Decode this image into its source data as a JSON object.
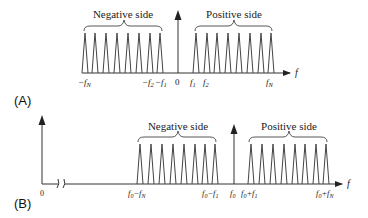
{
  "panels": {
    "a": {
      "label": "(A)",
      "negative_side_label": "Negative side",
      "positive_side_label": "Positive side",
      "axis_label": "f",
      "origin_label": "0",
      "tick_labels": {
        "neg_n": "−f",
        "neg_n_sub": "N",
        "neg_2": "−f",
        "neg_2_sub": "2",
        "neg_1": "−f",
        "neg_1_sub": "1",
        "pos_1": "f",
        "pos_1_sub": "1",
        "pos_2": "f",
        "pos_2_sub": "2",
        "pos_n": "f",
        "pos_n_sub": "N"
      },
      "peak_count_per_side": 8
    },
    "b": {
      "label": "(B)",
      "negative_side_label": "Negative side",
      "positive_side_label": "Positive side",
      "axis_label": "f",
      "origin_label": "0",
      "tick_labels": {
        "f0_minus_fn": "f",
        "f0_minus_fn_mid": "0",
        "f0_minus_fn_op": "−f",
        "f0_minus_fn_sub": "N",
        "f0_minus_f1": "f",
        "f0_minus_f1_mid": "0",
        "f0_minus_f1_op": "−f",
        "f0_minus_f1_sub": "1",
        "f0": "f",
        "f0_sub": "0",
        "f0_plus_f1": "f",
        "f0_plus_f1_mid": "0",
        "f0_plus_f1_op": "+f",
        "f0_plus_f1_sub": "1",
        "f0_plus_fn": "f",
        "f0_plus_fn_mid": "0",
        "f0_plus_fn_op": "+f",
        "f0_plus_fn_sub": "N"
      },
      "peak_count_per_side": 8
    }
  }
}
